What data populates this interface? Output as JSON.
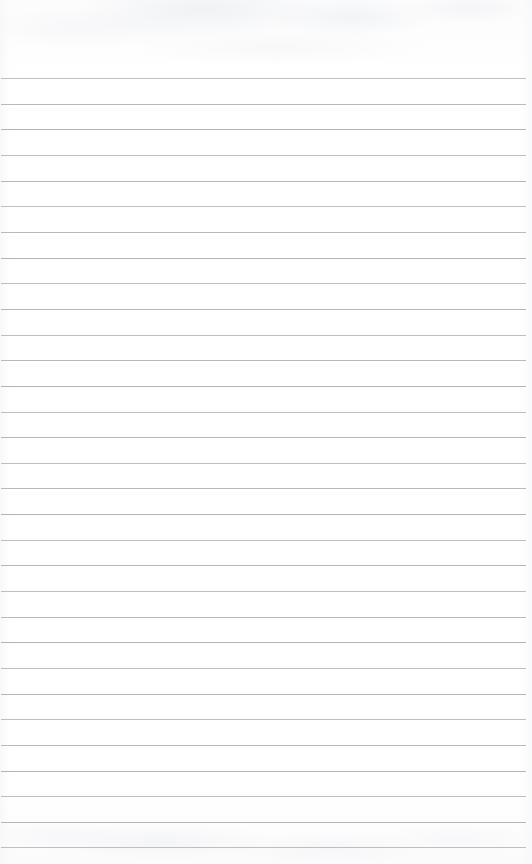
{
  "document": {
    "type": "ruled-notepad-page",
    "title": "Blank ruled notepad page",
    "text_content": "",
    "page_width_px": 532,
    "page_height_px": 864,
    "background_color": "#fefefe",
    "paper_tint": "#ffffff"
  },
  "ruling": {
    "line_color": "#aeb0b2",
    "line_thickness_px": 1,
    "line_count": 31,
    "first_line_y_px": 78,
    "last_line_y_px": 847,
    "line_spacing_px": 25.63,
    "line_left_x_px": 1,
    "line_right_x_px": 526,
    "line_width_px": 525,
    "top_margin_px": 78,
    "bottom_margin_px": 17,
    "left_margin_px": 1,
    "right_margin_px": 6,
    "margin_rule_present": false,
    "line_y_positions": [
      78,
      104,
      129,
      155,
      181,
      206,
      232,
      258,
      283,
      309,
      335,
      360,
      386,
      412,
      437,
      463,
      488,
      514,
      540,
      565,
      591,
      617,
      642,
      668,
      694,
      719,
      745,
      771,
      796,
      822,
      847
    ]
  },
  "labels": {
    "page_region": "notepad-page",
    "rule_region": "ruled-lines-area",
    "header_region": "blank-header-area",
    "footer_region": "blank-footer-area",
    "writing_area": "writing-area"
  }
}
